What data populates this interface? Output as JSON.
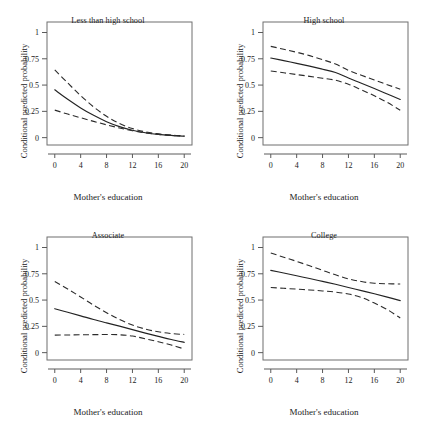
{
  "figure": {
    "background": "#ffffff",
    "line_color": "#232323",
    "frame_color": "#6f6f6f",
    "panel_count": 4,
    "layout": "2x2 grid of line charts"
  },
  "axis": {
    "xlabel": "Mother's education",
    "ylabel": "Conditional predicted probability",
    "xticks": [
      "0",
      "4",
      "8",
      "12",
      "16",
      "20"
    ],
    "yticks": [
      "0",
      "0.25",
      "0.5",
      "0.75",
      "1"
    ]
  },
  "panels": [
    {
      "title": "Less than high school"
    },
    {
      "title": "High school"
    },
    {
      "title": "Associate"
    },
    {
      "title": "College"
    }
  ],
  "chart_data": [
    {
      "type": "line",
      "title": "Less than high school",
      "xlabel": "Mother's education",
      "ylabel": "Conditional predicted probability",
      "xlim": [
        -1.2,
        21.2
      ],
      "ylim": [
        -0.07,
        1.1
      ],
      "xticks": [
        0,
        4,
        8,
        12,
        16,
        20
      ],
      "yticks": [
        0,
        0.25,
        0.5,
        0.75,
        1
      ],
      "grid": false,
      "legend": "none",
      "x": [
        0,
        2,
        4,
        6,
        8,
        10,
        12,
        14,
        16,
        18,
        20
      ],
      "series": [
        {
          "name": "Predicted probability",
          "style": "solid",
          "values": [
            0.455,
            0.365,
            0.283,
            0.212,
            0.152,
            0.105,
            0.07,
            0.047,
            0.031,
            0.021,
            0.014
          ]
        },
        {
          "name": "Upper 95% CI",
          "style": "dashed",
          "values": [
            0.645,
            0.52,
            0.4,
            0.292,
            0.203,
            0.134,
            0.086,
            0.055,
            0.036,
            0.024,
            0.017
          ]
        },
        {
          "name": "Lower 95% CI",
          "style": "dashed",
          "values": [
            0.262,
            0.224,
            0.189,
            0.155,
            0.122,
            0.092,
            0.066,
            0.046,
            0.031,
            0.021,
            0.013
          ]
        }
      ]
    },
    {
      "type": "line",
      "title": "High school",
      "xlabel": "Mother's education",
      "ylabel": "Conditional predicted probability",
      "xlim": [
        -1.2,
        21.2
      ],
      "ylim": [
        -0.07,
        1.1
      ],
      "xticks": [
        0,
        4,
        8,
        12,
        16,
        20
      ],
      "yticks": [
        0,
        0.25,
        0.5,
        0.75,
        1
      ],
      "grid": false,
      "legend": "none",
      "x": [
        0,
        2,
        4,
        6,
        8,
        10,
        12,
        14,
        16,
        18,
        20
      ],
      "series": [
        {
          "name": "Predicted probability",
          "style": "solid",
          "values": [
            0.757,
            0.733,
            0.707,
            0.68,
            0.651,
            0.62,
            0.567,
            0.518,
            0.467,
            0.415,
            0.363
          ]
        },
        {
          "name": "Upper 95% CI",
          "style": "dashed",
          "values": [
            0.868,
            0.841,
            0.812,
            0.78,
            0.742,
            0.7,
            0.64,
            0.593,
            0.549,
            0.504,
            0.46
          ]
        },
        {
          "name": "Lower 95% CI",
          "style": "dashed",
          "values": [
            0.634,
            0.617,
            0.6,
            0.583,
            0.565,
            0.546,
            0.508,
            0.455,
            0.398,
            0.335,
            0.26
          ]
        }
      ]
    },
    {
      "type": "line",
      "title": "Associate",
      "xlabel": "Mother's education",
      "ylabel": "Conditional predicted probability",
      "xlim": [
        -1.2,
        21.2
      ],
      "ylim": [
        -0.07,
        1.1
      ],
      "xticks": [
        0,
        4,
        8,
        12,
        16,
        20
      ],
      "yticks": [
        0,
        0.25,
        0.5,
        0.75,
        1
      ],
      "grid": false,
      "legend": "none",
      "x": [
        0,
        2,
        4,
        6,
        8,
        10,
        12,
        14,
        16,
        18,
        20
      ],
      "series": [
        {
          "name": "Predicted probability",
          "style": "solid",
          "values": [
            0.418,
            0.384,
            0.35,
            0.315,
            0.283,
            0.252,
            0.219,
            0.186,
            0.155,
            0.125,
            0.098
          ]
        },
        {
          "name": "Upper 95% CI",
          "style": "dashed",
          "values": [
            0.676,
            0.605,
            0.53,
            0.452,
            0.38,
            0.315,
            0.262,
            0.224,
            0.198,
            0.182,
            0.173
          ]
        },
        {
          "name": "Lower 95% CI",
          "style": "dashed",
          "values": [
            0.167,
            0.168,
            0.17,
            0.171,
            0.172,
            0.17,
            0.158,
            0.132,
            0.104,
            0.072,
            0.035
          ]
        }
      ]
    },
    {
      "type": "line",
      "title": "College",
      "xlabel": "Mother's education",
      "ylabel": "Conditional predicted probability",
      "xlim": [
        -1.2,
        21.2
      ],
      "ylim": [
        -0.07,
        1.1
      ],
      "xticks": [
        0,
        4,
        8,
        12,
        16,
        20
      ],
      "yticks": [
        0,
        0.25,
        0.5,
        0.75,
        1
      ],
      "grid": false,
      "legend": "none",
      "x": [
        0,
        2,
        4,
        6,
        8,
        10,
        12,
        14,
        16,
        18,
        20
      ],
      "series": [
        {
          "name": "Predicted probability",
          "style": "solid",
          "values": [
            0.783,
            0.757,
            0.731,
            0.705,
            0.678,
            0.65,
            0.62,
            0.59,
            0.56,
            0.528,
            0.495
          ]
        },
        {
          "name": "Upper 95% CI",
          "style": "dashed",
          "values": [
            0.948,
            0.908,
            0.868,
            0.826,
            0.783,
            0.74,
            0.702,
            0.676,
            0.66,
            0.655,
            0.653
          ]
        },
        {
          "name": "Lower 95% CI",
          "style": "dashed",
          "values": [
            0.619,
            0.612,
            0.604,
            0.596,
            0.587,
            0.576,
            0.558,
            0.525,
            0.472,
            0.41,
            0.33
          ]
        }
      ]
    }
  ]
}
